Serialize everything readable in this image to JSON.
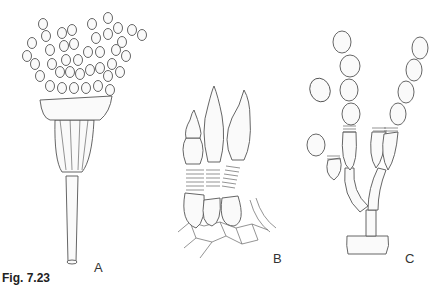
{
  "figure": {
    "caption": "Fig. 7.23",
    "panels": [
      {
        "label": "A",
        "description": "Penicillate conidiophore with branched phialides bearing chains of conidia"
      },
      {
        "label": "B",
        "description": "Phialides with annellations arising from basal cells on tissue"
      },
      {
        "label": "C",
        "description": "Branched conidiophore bearing chains of conidia with annellated conidiogenous cells"
      }
    ]
  }
}
